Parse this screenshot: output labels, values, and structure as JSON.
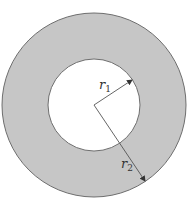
{
  "diagram": {
    "type": "annulus",
    "colors": {
      "ring_fill": "#c6c6c6",
      "ring_stroke": "#6e6e6e",
      "hole_fill": "#ffffff",
      "line": "#555555"
    },
    "labels": {
      "inner_radius": {
        "base": "r",
        "sub": "1"
      },
      "outer_radius": {
        "base": "r",
        "sub": "2"
      }
    }
  }
}
